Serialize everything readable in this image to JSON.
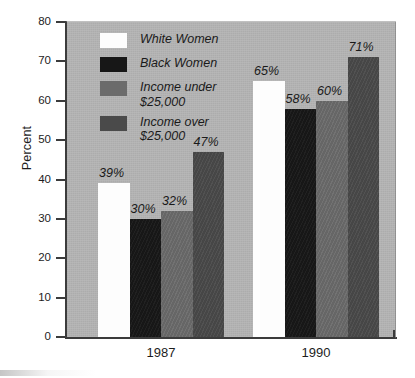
{
  "chart_data": {
    "type": "bar",
    "title": "",
    "subtitle": "",
    "xlabel": "",
    "ylabel": "Percent",
    "categories": [
      "1987",
      "1990"
    ],
    "series": [
      {
        "name": "White Women",
        "color": "#fdfdfd",
        "values": [
          39,
          65
        ],
        "labels": [
          "39%",
          "65%"
        ]
      },
      {
        "name": "Black Women",
        "color": "#171717",
        "values": [
          30,
          58
        ],
        "labels": [
          "30%",
          "58%"
        ]
      },
      {
        "name": "Income under $25,000",
        "color": "#6b6b6b",
        "values": [
          32,
          60
        ],
        "labels": [
          "32%",
          "60%"
        ]
      },
      {
        "name": "Income over $25,000",
        "color": "#4a4a4a",
        "values": [
          47,
          71
        ],
        "labels": [
          "47%",
          "71%"
        ]
      }
    ],
    "ylim": [
      0,
      80
    ],
    "ytick_step": 10,
    "yticks": [
      "80",
      "70",
      "60",
      "50",
      "40",
      "30",
      "20",
      "10",
      "0"
    ],
    "grid": false,
    "legend_position": "inside-top-left",
    "plot_background": "#b4b4b4",
    "axis_color": "#3b3b3b",
    "value_label_suffix": "%"
  },
  "axis": {
    "y_title": "Percent",
    "y_ticks": [
      {
        "value": 80,
        "label": "80"
      },
      {
        "value": 70,
        "label": "70"
      },
      {
        "value": 60,
        "label": "60"
      },
      {
        "value": 50,
        "label": "50"
      },
      {
        "value": 40,
        "label": "40"
      },
      {
        "value": 30,
        "label": "30"
      },
      {
        "value": 20,
        "label": "20"
      },
      {
        "value": 10,
        "label": "10"
      },
      {
        "value": 0,
        "label": "0"
      }
    ],
    "x_ticks": [
      {
        "label": "1987"
      },
      {
        "label": "1990"
      }
    ]
  },
  "legend": {
    "items": [
      {
        "swatch": "white",
        "line1": "White Women",
        "line2": ""
      },
      {
        "swatch": "black",
        "line1": "Black Women",
        "line2": ""
      },
      {
        "swatch": "gray",
        "line1": "Income under",
        "line2": "$25,000"
      },
      {
        "swatch": "darkgray",
        "line1": "Income over",
        "line2": "$25,000"
      }
    ]
  },
  "bars": [
    {
      "group": "1987",
      "series": "White Women",
      "label": "39%",
      "value": 39,
      "class": "white"
    },
    {
      "group": "1987",
      "series": "Black Women",
      "label": "30%",
      "value": 30,
      "class": "black"
    },
    {
      "group": "1987",
      "series": "Income under $25,000",
      "label": "32%",
      "value": 32,
      "class": "gray"
    },
    {
      "group": "1987",
      "series": "Income over $25,000",
      "label": "47%",
      "value": 47,
      "class": "darkgray"
    },
    {
      "group": "1990",
      "series": "White Women",
      "label": "65%",
      "value": 65,
      "class": "white"
    },
    {
      "group": "1990",
      "series": "Black Women",
      "label": "58%",
      "value": 58,
      "class": "black"
    },
    {
      "group": "1990",
      "series": "Income under $25,000",
      "label": "60%",
      "value": 60,
      "class": "gray"
    },
    {
      "group": "1990",
      "series": "Income over $25,000",
      "label": "71%",
      "value": 71,
      "class": "darkgray"
    }
  ]
}
